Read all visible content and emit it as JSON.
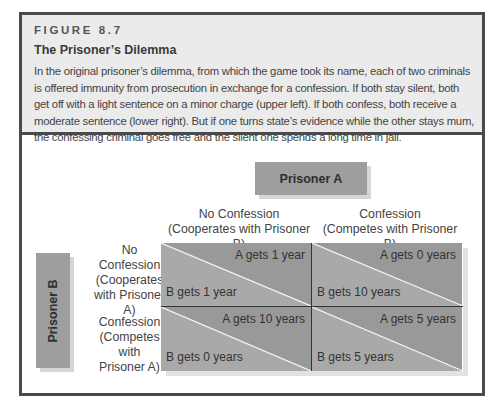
{
  "figure": {
    "number": "FIGURE 8.7",
    "title": "The Prisoner’s Dilemma",
    "description": "In the original prisoner’s dilemma, from which the game took its name, each of two criminals is offered immunity from prosecution in exchange for a confession. If both stay silent, both get off with a light sentence on a minor charge (upper left). If both confess, both receive a moderate sentence (lower right). But if one turns state’s evidence while the other stays mum, the confessing criminal goes free and the silent one spends a long time in jail."
  },
  "matrix": {
    "player_a": "Prisoner A",
    "player_b": "Prisoner B",
    "columns": [
      {
        "line1": "No Confession",
        "line2": "(Cooperates with Prisoner B)"
      },
      {
        "line1": "Confession",
        "line2": "(Competes with Prisoner B)"
      }
    ],
    "rows": [
      {
        "line1": "No",
        "line2": "Confession",
        "line3": "(Cooperates",
        "line4": "with Prisoner A)"
      },
      {
        "line1": "Confession",
        "line2": "(Competes with",
        "line3": "Prisoner A)"
      }
    ],
    "cells": [
      [
        {
          "a": "A gets 1 year",
          "b": "B gets 1 year"
        },
        {
          "a": "A gets 0 years",
          "b": "B gets 10 years"
        }
      ],
      [
        {
          "a": "A gets 10 years",
          "b": "B gets 0 years"
        },
        {
          "a": "A gets 5 years",
          "b": "B gets 5 years"
        }
      ]
    ],
    "colors": {
      "upper_triangle": "#999999",
      "lower_triangle": "#a9a9a9",
      "diagonal": "#f2f2f2"
    }
  }
}
